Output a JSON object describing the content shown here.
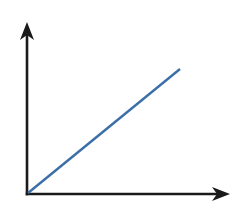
{
  "diagram": {
    "type": "axes-with-linear-line",
    "colors": {
      "axis": "#1a1a1a",
      "line": "#3b6fa8",
      "background": "#ffffff"
    },
    "axes": {
      "origin": [
        27,
        194
      ],
      "y_axis_tip": [
        27,
        22
      ],
      "x_axis_tip": [
        230,
        194
      ]
    },
    "line": {
      "start": [
        28,
        193
      ],
      "end": [
        180,
        69
      ]
    }
  }
}
